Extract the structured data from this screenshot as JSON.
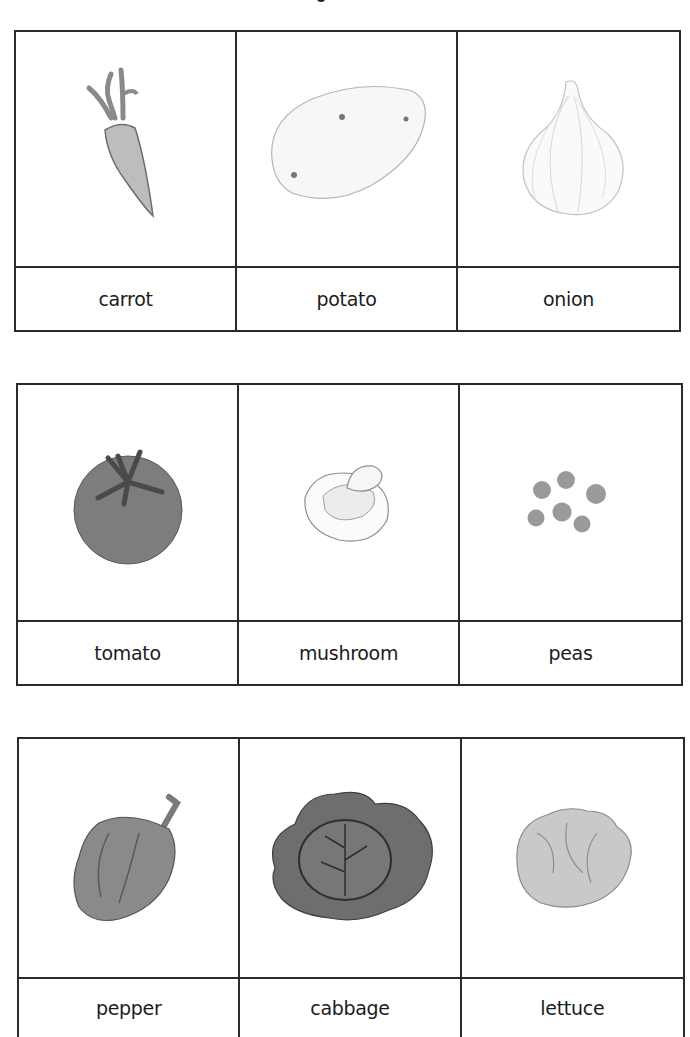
{
  "worksheet": {
    "rows": [
      {
        "cards": [
          {
            "label": "carrot",
            "icon": "carrot-drawing"
          },
          {
            "label": "potato",
            "icon": "potato-drawing"
          },
          {
            "label": "onion",
            "icon": "onion-drawing"
          }
        ]
      },
      {
        "cards": [
          {
            "label": "tomato",
            "icon": "tomato-drawing"
          },
          {
            "label": "mushroom",
            "icon": "mushroom-drawing"
          },
          {
            "label": "peas",
            "icon": "peas-drawing"
          }
        ]
      },
      {
        "cards": [
          {
            "label": "pepper",
            "icon": "pepper-drawing"
          },
          {
            "label": "cabbage",
            "icon": "cabbage-drawing"
          },
          {
            "label": "lettuce",
            "icon": "lettuce-drawing"
          }
        ]
      }
    ]
  },
  "colors": {
    "border": "#2a2a2a",
    "text": "#1c1c1c",
    "background": "#ffffff"
  }
}
